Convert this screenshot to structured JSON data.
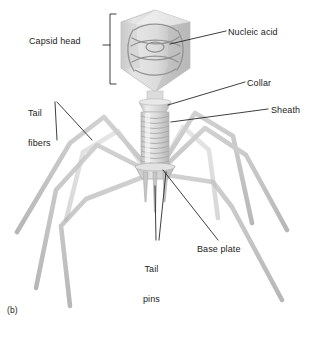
{
  "figure": {
    "part_label": "(b)",
    "background_color": "#ffffff",
    "ink_color": "#1c1c1c",
    "body_fill": "#d9d9d9",
    "body_shade": "#b3b3b3",
    "body_highlight": "#f0f0f0",
    "nucleic_acid_stroke": "#8a8a8a",
    "fiber_color": "#bdbdbd"
  },
  "labels": {
    "capsid_head": "Capsid head",
    "nucleic_acid": "Nucleic acid",
    "collar": "Collar",
    "sheath": "Sheath",
    "tail_fibers_line1": "Tail",
    "tail_fibers_line2": "fibers",
    "tail_pins_line1": "Tail",
    "tail_pins_line2": "pins",
    "base_plate": "Base plate"
  },
  "parts": [
    {
      "name": "capsid-head",
      "label": "Capsid head",
      "callout": "bracket"
    },
    {
      "name": "nucleic-acid",
      "label": "Nucleic acid",
      "callout": "leader-line"
    },
    {
      "name": "collar",
      "label": "Collar",
      "callout": "leader-line"
    },
    {
      "name": "sheath",
      "label": "Sheath",
      "callout": "leader-line"
    },
    {
      "name": "tail-fibers",
      "label": "Tail fibers",
      "callout": "leader-line-double"
    },
    {
      "name": "tail-pins",
      "label": "Tail pins",
      "callout": "leader-line-double"
    },
    {
      "name": "base-plate",
      "label": "Base plate",
      "callout": "leader-line"
    }
  ]
}
